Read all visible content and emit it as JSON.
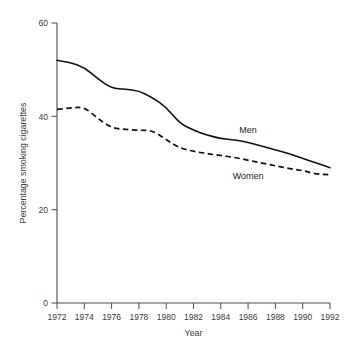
{
  "chart_data": {
    "type": "line",
    "title": "",
    "xlabel": "Year",
    "ylabel": "Percentage smoking cigarettes",
    "x": [
      1972,
      1973,
      1974,
      1975,
      1976,
      1977,
      1978,
      1979,
      1980,
      1981,
      1982,
      1983,
      1984,
      1985,
      1986,
      1987,
      1988,
      1989,
      1990,
      1991,
      1992
    ],
    "xlim": [
      1972,
      1992
    ],
    "ylim": [
      0,
      60
    ],
    "xticks": [
      1972,
      1974,
      1976,
      1978,
      1980,
      1982,
      1984,
      1986,
      1988,
      1990,
      1992
    ],
    "xtick_labels": [
      "1972",
      "1974",
      "1976",
      "1978",
      "1980",
      "1982",
      "1984",
      "1986",
      "1988",
      "1990",
      "1992"
    ],
    "yticks": [
      0,
      20,
      40,
      60
    ],
    "ytick_labels": [
      "0",
      "20",
      "40",
      "60"
    ],
    "grid": false,
    "legend_position": "inline-annotation",
    "series": [
      {
        "name": "Men",
        "style": "solid",
        "color": "#111111",
        "label_text": "Men",
        "values": [
          52.0,
          51.5,
          50.5,
          48.0,
          46.0,
          45.8,
          45.5,
          44.0,
          42.0,
          38.5,
          37.0,
          36.0,
          35.2,
          35.0,
          34.4,
          33.6,
          32.8,
          32.0,
          31.0,
          30.0,
          29.0
        ]
      },
      {
        "name": "Women",
        "style": "dashed",
        "color": "#111111",
        "label_text": "Women",
        "values": [
          41.5,
          41.8,
          42.0,
          39.5,
          37.5,
          37.2,
          37.0,
          37.0,
          35.0,
          33.2,
          32.5,
          32.0,
          31.6,
          31.2,
          30.6,
          30.0,
          29.4,
          28.8,
          28.4,
          27.6,
          27.5
        ]
      }
    ],
    "annotations": [
      {
        "text": "Men",
        "x": 1986,
        "y": 36.5
      },
      {
        "text": "Women",
        "x": 1986,
        "y": 26.5
      }
    ]
  }
}
